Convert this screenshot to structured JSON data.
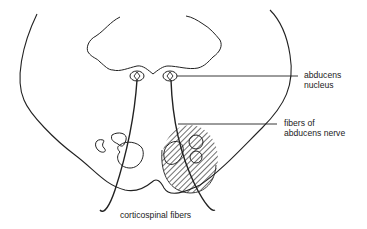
{
  "diagram": {
    "type": "neuroanatomy cross-section (caudal pons)",
    "stroke_color": "#222222",
    "background": "#ffffff",
    "labels": {
      "abducens_nucleus_line1": "abducens",
      "abducens_nucleus_line2": "nucleus",
      "abducens_nerve_line1": "fibers of",
      "abducens_nerve_line2": "abducens nerve",
      "corticospinal": "corticospinal fibers"
    },
    "structures": [
      "brainstem outline",
      "fourth ventricle",
      "abducens nucleus (left)",
      "abducens nucleus (right)",
      "fibers of abducens nerve (left)",
      "fibers of abducens nerve (right)",
      "corticospinal fibers (left)",
      "corticospinal fibers (right, hatched lesion)",
      "lesion area (hatched)"
    ]
  }
}
